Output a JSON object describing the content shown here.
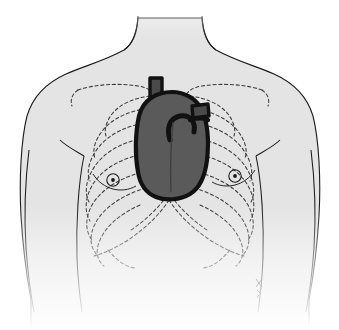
{
  "figure": {
    "caption_remnant": "",
    "background_color": "#ffffff"
  },
  "colors": {
    "skin_fill": "#e4e4e4",
    "skin_fill_light": "#ededed",
    "outline": "#1a1a1a",
    "heart_fill": "#5a5a5a",
    "heart_outline": "#111111",
    "vessel_fill": "#4a4a4a",
    "bone_dash": "#3a3a3a",
    "fade_white": "#ffffff"
  },
  "parts": {
    "torso": {
      "label": "Torso outline",
      "name": "torso-outline"
    },
    "neck": {
      "label": "Neck"
    },
    "left_shoulder": {
      "label": "Shoulder (viewer left)"
    },
    "right_shoulder": {
      "label": "Shoulder (viewer right)"
    },
    "left_arm": {
      "label": "Upper arm (viewer left)"
    },
    "right_arm": {
      "label": "Upper arm (viewer right)"
    },
    "left_nipple": {
      "label": "Nipple (viewer left)"
    },
    "right_nipple": {
      "label": "Nipple (viewer right)"
    },
    "clavicle_left": {
      "label": "Clavicle (viewer left)"
    },
    "clavicle_right": {
      "label": "Clavicle (viewer right)"
    },
    "ribcage": {
      "label": "Rib cage (dashed, hidden outline)",
      "rib_count_per_side": 8,
      "line_style": "dashed"
    },
    "costal_margin": {
      "label": "Costal margin"
    },
    "sternum": {
      "label": "Sternum"
    },
    "heart": {
      "label": "Heart",
      "fill": "#5a5a5a",
      "outline": "#111111"
    },
    "superior_vena_cava": {
      "label": "Superior vena cava"
    },
    "aortic_arch": {
      "label": "Aortic arch"
    },
    "pulmonary_trunk": {
      "label": "Pulmonary trunk"
    },
    "brachiocephalic_vessels": {
      "label": "Brachiocephalic vessels"
    },
    "signature": {
      "label": "Artist signature mark",
      "text": ""
    }
  }
}
